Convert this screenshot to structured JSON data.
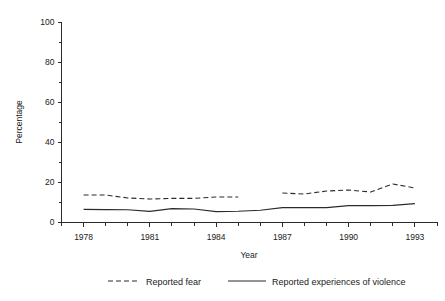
{
  "chart_data": {
    "type": "line",
    "title": "",
    "xlabel": "Year",
    "ylabel": "Percentage",
    "xlim": [
      1977,
      1994
    ],
    "ylim": [
      0,
      100
    ],
    "grid": false,
    "legend_position": "bottom",
    "y_ticks_major": [
      0,
      20,
      40,
      60,
      80,
      100
    ],
    "y_ticks_minor": [
      10,
      30,
      50,
      70,
      90
    ],
    "x_tick_labels": [
      "1978",
      "1981",
      "1984",
      "1987",
      "1990",
      "1993"
    ],
    "x_tick_values": [
      1978,
      1981,
      1984,
      1987,
      1990,
      1993
    ],
    "x_minor_ticks": [
      1977,
      1979,
      1980,
      1982,
      1983,
      1985,
      1986,
      1988,
      1989,
      1991,
      1992,
      1994
    ],
    "x": [
      1978,
      1979,
      1980,
      1981,
      1982,
      1983,
      1984,
      1985,
      1986,
      1987,
      1988,
      1989,
      1990,
      1991,
      1992,
      1993
    ],
    "series": [
      {
        "name": "Reported fear",
        "style": "dashed",
        "color": "#2b2b2b",
        "values": [
          13.5,
          13.5,
          12.0,
          11.5,
          11.8,
          11.8,
          12.5,
          12.5,
          null,
          14.5,
          14.0,
          15.5,
          16.0,
          15.0,
          19.0,
          17.0
        ]
      },
      {
        "name": "Reported experiences of violence",
        "style": "solid",
        "color": "#2b2b2b",
        "values": [
          6.3,
          6.2,
          6.1,
          5.3,
          6.7,
          6.5,
          5.2,
          5.4,
          5.9,
          7.2,
          7.2,
          7.2,
          8.2,
          8.2,
          8.3,
          9.2
        ]
      }
    ]
  },
  "legend": {
    "items": [
      {
        "label": "Reported fear",
        "style": "dashed"
      },
      {
        "label": "Reported experiences of violence",
        "style": "solid"
      }
    ]
  }
}
